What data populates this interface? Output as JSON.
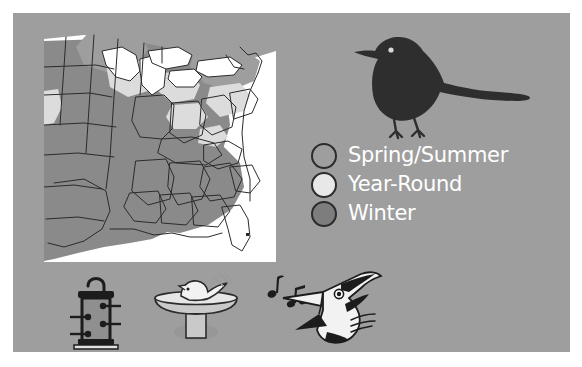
{
  "panel": {
    "background_color": "#9e9e9e",
    "border_color": "#ffffff"
  },
  "map": {
    "name": "range-map-eastern-united-states",
    "title": "Eastern and central United States range map",
    "ocean_color": "#ffffff",
    "border_color": "#2b2b2b",
    "regions": [
      {
        "name": "winter-range",
        "color": "#8a8a8a"
      },
      {
        "name": "spring-summer-range",
        "color": "#9e9e9e"
      },
      {
        "name": "year-round-range",
        "color": "#dcdcdc"
      },
      {
        "name": "great-lakes-water",
        "color": "#ffffff"
      }
    ]
  },
  "bird_illustration": {
    "name": "perched-songbird-silhouette",
    "color": "#2e2e2e",
    "eye_color": "#d8d8d8",
    "description": "Dark songbird silhouette facing left with long tail"
  },
  "legend": {
    "items": [
      {
        "label": "Spring/Summer",
        "swatch_color": "#9e9e9e",
        "swatch_outline": "#2b2b2b"
      },
      {
        "label": "Year-Round",
        "swatch_color": "#e8e8e8",
        "swatch_outline": "#2b2b2b"
      },
      {
        "label": "Winter",
        "swatch_color": "#7d7d7d",
        "swatch_outline": "#2b2b2b"
      }
    ],
    "text_color": "#ffffff"
  },
  "icons": [
    {
      "name": "tube-bird-feeder-icon",
      "label": "Bird feeder",
      "body_color": "#8f8f8f",
      "outline_color": "#1c1c1c"
    },
    {
      "name": "bird-bath-icon",
      "label": "Bird bath with bathing bird",
      "body_color": "#c9c9c9",
      "outline_color": "#2b2b2b"
    },
    {
      "name": "singing-bird-head-icon",
      "label": "Singing bird head with music notes",
      "body_color": "#f2f2f2",
      "outline_color": "#1c1c1c",
      "note_color": "#1c1c1c"
    }
  ]
}
